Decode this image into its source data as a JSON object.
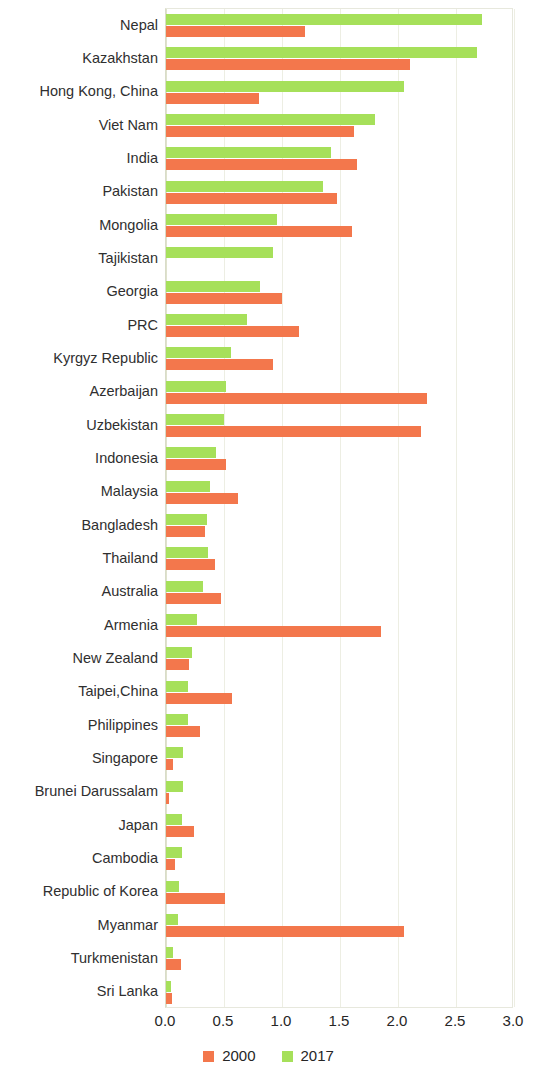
{
  "chart_data": {
    "type": "bar",
    "orientation": "horizontal",
    "title": "",
    "xlabel": "",
    "ylabel": "",
    "xlim": [
      0.0,
      3.0
    ],
    "xticks": [
      "0.0",
      "0.5",
      "1.0",
      "1.5",
      "2.0",
      "2.5",
      "3.0"
    ],
    "xtick_values": [
      0.0,
      0.5,
      1.0,
      1.5,
      2.0,
      2.5,
      3.0
    ],
    "grid": true,
    "legend_position": "bottom",
    "categories": [
      "Nepal",
      "Kazakhstan",
      "Hong Kong, China",
      "Viet Nam",
      "India",
      "Pakistan",
      "Mongolia",
      "Tajikistan",
      "Georgia",
      "PRC",
      "Kyrgyz Republic",
      "Azerbaijan",
      "Uzbekistan",
      "Indonesia",
      "Malaysia",
      "Bangladesh",
      "Thailand",
      "Australia",
      "Armenia",
      "New Zealand",
      "Taipei,China",
      "Philippines",
      "Singapore",
      "Brunei Darussalam",
      "Japan",
      "Cambodia",
      "Republic of Korea",
      "Myanmar",
      "Turkmenistan",
      "Sri Lanka"
    ],
    "series": [
      {
        "name": "2000",
        "color": "#f3774c",
        "values": [
          1.2,
          2.1,
          0.8,
          1.62,
          1.65,
          1.47,
          1.6,
          0.0,
          1.0,
          1.15,
          0.92,
          2.25,
          2.2,
          0.52,
          0.62,
          0.34,
          0.42,
          0.47,
          1.85,
          0.2,
          0.57,
          0.29,
          0.06,
          0.03,
          0.24,
          0.08,
          0.51,
          2.05,
          0.13,
          0.05
        ]
      },
      {
        "name": "2017",
        "color": "#a6e05a",
        "values": [
          2.72,
          2.68,
          2.05,
          1.8,
          1.42,
          1.35,
          0.96,
          0.92,
          0.81,
          0.7,
          0.56,
          0.52,
          0.5,
          0.43,
          0.38,
          0.35,
          0.36,
          0.32,
          0.27,
          0.22,
          0.19,
          0.19,
          0.15,
          0.15,
          0.14,
          0.14,
          0.11,
          0.1,
          0.06,
          0.04
        ]
      }
    ]
  },
  "legend": {
    "items": [
      {
        "label": "2000",
        "color": "#f3774c"
      },
      {
        "label": "2017",
        "color": "#a6e05a"
      }
    ]
  },
  "colors": {
    "series_2000": "#f3774c",
    "series_2017": "#a6e05a",
    "gridline": "#edeee3",
    "plot_border": "#e7e8dd",
    "text": "#2b2b2b",
    "background": "#ffffff"
  }
}
